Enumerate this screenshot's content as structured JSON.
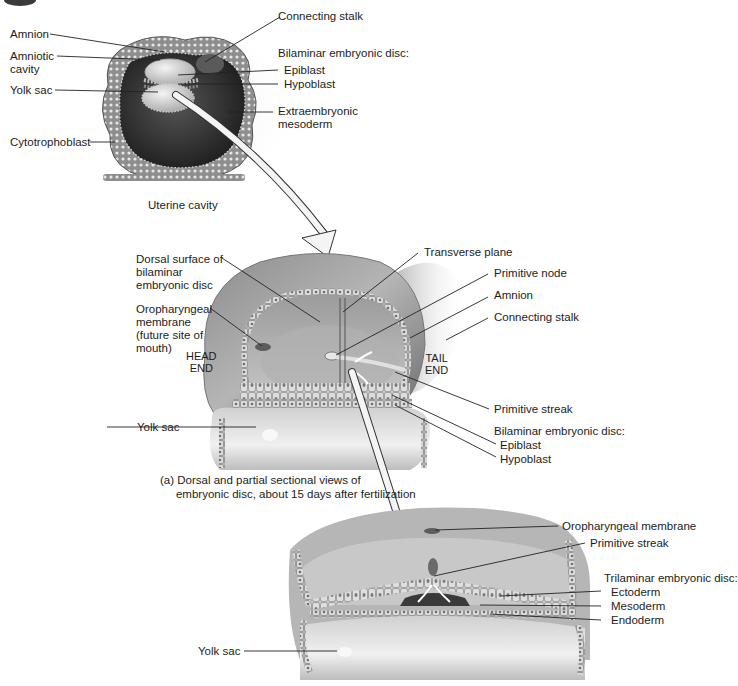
{
  "figure_a_top": {
    "labels": {
      "amnion": "Amnion",
      "amniotic_cavity": "Amniotic\ncavity",
      "yolk_sac": "Yolk sac",
      "cytotrophoblast": "Cytotrophoblast",
      "connecting_stalk": "Connecting stalk",
      "bilaminar_heading": "Bilaminar embryonic disc:",
      "epiblast": "Epiblast",
      "hypoblast": "Hypoblast",
      "extraembryonic_mesoderm": "Extraembryonic\nmesoderm",
      "uterine_cavity": "Uterine cavity"
    }
  },
  "figure_a_middle": {
    "labels": {
      "dorsal_surface": "Dorsal surface of\nbilaminar\nembryonic disc",
      "oropharyngeal_membrane": "Oropharyngeal\nmembrane\n(future site of\nmouth)",
      "head_end": "HEAD\nEND",
      "tail_end": "TAIL\nEND",
      "yolk_sac": "Yolk sac",
      "transverse_plane": "Transverse plane",
      "primitive_node": "Primitive node",
      "amnion": "Amnion",
      "connecting_stalk": "Connecting stalk",
      "primitive_streak": "Primitive streak",
      "bilaminar_heading": "Bilaminar embryonic disc:",
      "epiblast": "Epiblast",
      "hypoblast": "Hypoblast"
    },
    "caption": "(a) Dorsal and partial sectional views of\n     embryonic disc, about 15 days after fertilization"
  },
  "figure_b_bottom": {
    "labels": {
      "oropharyngeal_membrane": "Oropharyngeal membrane",
      "primitive_streak": "Primitive streak",
      "trilaminar_heading": "Trilaminar embryonic disc:",
      "ectoderm": "Ectoderm",
      "mesoderm": "Mesoderm",
      "endoderm": "Endoderm",
      "yolk_sac": "Yolk sac"
    }
  },
  "colors": {
    "tissue_dark": "#3a3a3a",
    "tissue_mid": "#8a8a8a",
    "tissue_light": "#d2d2d2",
    "leader_line": "#222222",
    "arrow_fill": "#f2f2f2"
  }
}
